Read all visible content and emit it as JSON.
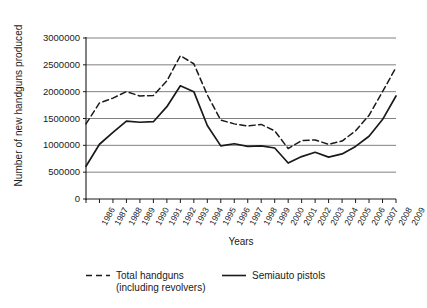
{
  "chart_data": {
    "type": "line",
    "title": "",
    "xlabel": "Years",
    "ylabel": "Number of new handguns produced",
    "ylim": [
      0,
      3000000
    ],
    "ytick_labels": [
      "0",
      "500000",
      "1000000",
      "1500000",
      "2000000",
      "2500000",
      "3000000"
    ],
    "ytick_values": [
      0,
      500000,
      1000000,
      1500000,
      2000000,
      2500000,
      3000000
    ],
    "grid": "horizontal",
    "legend_position": "below",
    "categories": [
      "1986",
      "1987",
      "1988",
      "1989",
      "1990",
      "1991",
      "1992",
      "1993",
      "1994",
      "1995",
      "1996",
      "1997",
      "1998",
      "1999",
      "2000",
      "2001",
      "2002",
      "2003",
      "2004",
      "2005",
      "2006",
      "2007",
      "2008",
      "2009"
    ],
    "series": [
      {
        "name": "Total handguns (including revolvers)",
        "style": "dashed",
        "color": "#1a1a1a",
        "values": [
          1400000,
          1790000,
          1880000,
          2000000,
          1920000,
          1930000,
          2200000,
          2670000,
          2520000,
          1940000,
          1470000,
          1400000,
          1360000,
          1390000,
          1270000,
          940000,
          1090000,
          1100000,
          1020000,
          1080000,
          1270000,
          1560000,
          2000000,
          2450000
        ]
      },
      {
        "name": "Semiauto pistols",
        "style": "solid",
        "color": "#1a1a1a",
        "values": [
          610000,
          1020000,
          1240000,
          1450000,
          1430000,
          1440000,
          1720000,
          2110000,
          2000000,
          1370000,
          990000,
          1030000,
          980000,
          990000,
          950000,
          670000,
          790000,
          870000,
          780000,
          840000,
          980000,
          1170000,
          1480000,
          1920000
        ]
      }
    ]
  },
  "axes": {
    "y_title": "Number of new handguns produced",
    "x_title": "Years"
  },
  "legend": {
    "entries": [
      {
        "label_line1": "Total handguns",
        "label_line2": "(including revolvers)",
        "style": "dashed"
      },
      {
        "label_line1": "Semiauto pistols",
        "label_line2": "",
        "style": "solid"
      }
    ]
  }
}
